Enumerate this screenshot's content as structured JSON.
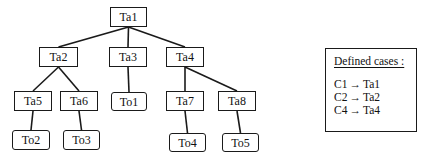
{
  "nodes": [
    {
      "id": "Ta1",
      "label": "Ta1",
      "kind": "ta"
    },
    {
      "id": "Ta2",
      "label": "Ta2",
      "kind": "ta"
    },
    {
      "id": "Ta3",
      "label": "Ta3",
      "kind": "ta"
    },
    {
      "id": "Ta4",
      "label": "Ta4",
      "kind": "ta"
    },
    {
      "id": "Ta5",
      "label": "Ta5",
      "kind": "ta"
    },
    {
      "id": "Ta6",
      "label": "Ta6",
      "kind": "ta"
    },
    {
      "id": "To1",
      "label": "To1",
      "kind": "to"
    },
    {
      "id": "Ta7",
      "label": "Ta7",
      "kind": "ta"
    },
    {
      "id": "Ta8",
      "label": "Ta8",
      "kind": "ta"
    },
    {
      "id": "To2",
      "label": "To2",
      "kind": "to"
    },
    {
      "id": "To3",
      "label": "To3",
      "kind": "to"
    },
    {
      "id": "To4",
      "label": "To4",
      "kind": "to"
    },
    {
      "id": "To5",
      "label": "To5",
      "kind": "to"
    }
  ],
  "edges": [
    [
      "Ta1",
      "Ta2"
    ],
    [
      "Ta1",
      "Ta3"
    ],
    [
      "Ta1",
      "Ta4"
    ],
    [
      "Ta2",
      "Ta5"
    ],
    [
      "Ta2",
      "Ta6"
    ],
    [
      "Ta3",
      "To1"
    ],
    [
      "Ta4",
      "Ta7"
    ],
    [
      "Ta4",
      "Ta8"
    ],
    [
      "Ta5",
      "To2"
    ],
    [
      "Ta6",
      "To3"
    ],
    [
      "Ta7",
      "To4"
    ],
    [
      "Ta8",
      "To5"
    ]
  ],
  "legend": {
    "title": "Defined cases :",
    "arrow": "→",
    "cases": [
      {
        "case": "C1",
        "target": "Ta1"
      },
      {
        "case": "C2",
        "target": "Ta2"
      },
      {
        "case": "C4",
        "target": "Ta4"
      }
    ]
  }
}
